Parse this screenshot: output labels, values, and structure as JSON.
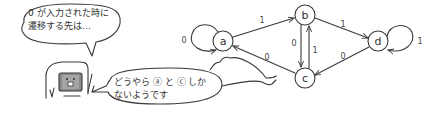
{
  "speech_bubbles": {
    "top": {
      "line1": "0 が入力された時に",
      "line2": "遷移する先は…"
    },
    "bottom": {
      "line1": "どうやら ⓐ と ⓒ しか",
      "line2": "ないようです"
    }
  },
  "automaton": {
    "nodes": [
      {
        "id": "a",
        "label": "a"
      },
      {
        "id": "b",
        "label": "b"
      },
      {
        "id": "c",
        "label": "c"
      },
      {
        "id": "d",
        "label": "d"
      }
    ],
    "edges": [
      {
        "from": "a",
        "to": "a",
        "label": "0"
      },
      {
        "from": "a",
        "to": "b",
        "label": "1"
      },
      {
        "from": "b",
        "to": "c",
        "label": "0"
      },
      {
        "from": "c",
        "to": "b",
        "label": "1"
      },
      {
        "from": "c",
        "to": "a",
        "label": "0"
      },
      {
        "from": "b",
        "to": "d",
        "label": "1"
      },
      {
        "from": "d",
        "to": "c",
        "label": "0"
      },
      {
        "from": "d",
        "to": "d",
        "label": "1"
      }
    ]
  },
  "colors": {
    "line": "#3a3a3a",
    "screen": "#8a8a8a",
    "background": "#ffffff"
  }
}
